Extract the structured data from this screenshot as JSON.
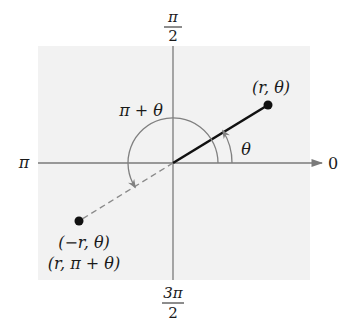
{
  "diagram": {
    "colors": {
      "background": "#ffffff",
      "panel": "#f2f2f2",
      "axis": "#7a7a7a",
      "segment": "#111111",
      "dashed": "#8a8a8a",
      "arc": "#808080",
      "point": "#111111"
    },
    "axis_labels": {
      "top_num": "π",
      "top_den": "2",
      "bottom_num": "3π",
      "bottom_den": "2",
      "left": "π",
      "right": "0"
    },
    "points": {
      "p1_label": "(r, θ)",
      "p2_label_line1": "(−r, θ)",
      "p2_label_line2": "(r, π + θ)"
    },
    "angle_labels": {
      "theta": "θ",
      "pi_plus_theta": "π + θ"
    }
  }
}
